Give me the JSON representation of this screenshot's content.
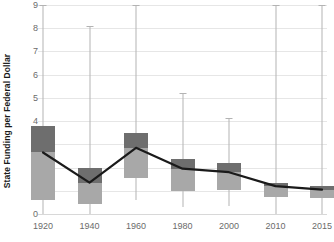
{
  "chart_data": {
    "type": "bar",
    "chart_kind": "box-plot-with-median-trend",
    "title": "",
    "xlabel": "",
    "ylabel": "State Funding per Federal Dollar",
    "ylim": [
      0,
      9
    ],
    "ytick_labels": [
      "0",
      "1",
      "2",
      "3",
      "4",
      "5",
      "6",
      "7",
      "8",
      "9"
    ],
    "yticks": [
      0,
      1,
      2,
      3,
      4,
      5,
      6,
      7,
      8,
      9
    ],
    "grid": true,
    "legend": "none",
    "categories": [
      "1920",
      "1940",
      "1960",
      "1980",
      "2000",
      "2010",
      "2015"
    ],
    "series": [
      {
        "name": "Whisker High",
        "values": [
          9.0,
          8.1,
          9.0,
          5.2,
          4.15,
          9.0,
          9.0
        ]
      },
      {
        "name": "Q3 (box top)",
        "values": [
          3.8,
          2.0,
          3.5,
          2.35,
          2.2,
          1.35,
          1.2
        ]
      },
      {
        "name": "Median",
        "values": [
          2.65,
          1.35,
          2.85,
          1.95,
          1.8,
          1.2,
          1.05
        ]
      },
      {
        "name": "Q1 (box bottom)",
        "values": [
          0.6,
          0.45,
          1.55,
          1.0,
          1.05,
          0.75,
          0.7
        ]
      },
      {
        "name": "Whisker Low",
        "values": [
          0.0,
          0.0,
          0.6,
          0.3,
          0.35,
          0.0,
          0.0
        ]
      }
    ],
    "colors": {
      "box_upper": "#6e6e6e",
      "box_lower": "#a8a8a8",
      "whisker": "#b3b3b3",
      "median_line": "#1a1a1a",
      "gridline": "#e6e6e6",
      "tick_text": "#6b6b6b",
      "axis_title": "#1a1a1a",
      "background": "#ffffff"
    }
  }
}
